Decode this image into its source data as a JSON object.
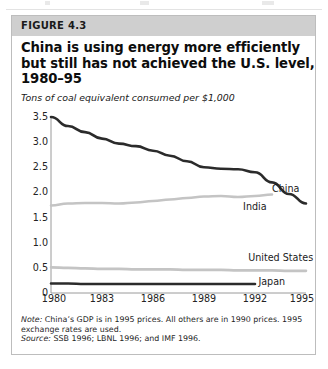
{
  "figure": {
    "band_label": "FIGURE 4.3",
    "title_lines": [
      "China is using energy more efficiently",
      "but still has not achieved the U.S. level,",
      "1980–95"
    ],
    "subtitle": "Tons of coal equivalent consumed per $1,000",
    "notes": {
      "note_kicker": "Note:",
      "note_line1": " China’s GDP is in 1995 prices. All others are in 1990 prices. 1995",
      "note_line2": "exchange rates are used.",
      "source_kicker": "Source:",
      "source_text": " SSB 1996; LBNL 1996; and IMF 1996."
    },
    "colors": {
      "band": "#cfcfcf",
      "border": "#bdbdbd",
      "dark_series": "#2b2b2b",
      "light_series": "#c4c4c4",
      "axis": "#9a9a9a",
      "text": "#1a1a1a"
    }
  },
  "chart_data": {
    "type": "line",
    "title": "China is using energy more efficiently but still has not achieved the U.S. level, 1980–95",
    "ylabel": "Tons of coal equivalent consumed per $1,000",
    "xlabel": "",
    "xlim": [
      1980,
      1995
    ],
    "ylim": [
      0,
      3.5
    ],
    "yticks": [
      0,
      0.5,
      1.0,
      1.5,
      2.0,
      2.5,
      3.0,
      3.5
    ],
    "ytick_labels": [
      "0",
      "0.5",
      "1.0",
      "1.5",
      "2.0",
      "2.5",
      "3.0",
      "3.5"
    ],
    "xticks": [
      1980,
      1983,
      1986,
      1989,
      1992,
      1995
    ],
    "xtick_labels": [
      "1980",
      "1983",
      "1986",
      "1989",
      "1992",
      "1995"
    ],
    "grid": false,
    "legend": "inline-labels",
    "x": [
      1980,
      1981,
      1982,
      1983,
      1984,
      1985,
      1986,
      1987,
      1988,
      1989,
      1990,
      1991,
      1992,
      1993,
      1994,
      1995
    ],
    "series": [
      {
        "name": "China",
        "label": "China",
        "color": "#2b2b2b",
        "width": 2.6,
        "label_x": 1993.0,
        "label_y": 2.06,
        "values": [
          3.5,
          3.32,
          3.2,
          3.07,
          2.97,
          2.92,
          2.83,
          2.73,
          2.62,
          2.5,
          2.47,
          2.46,
          2.4,
          2.2,
          1.97,
          1.78
        ]
      },
      {
        "name": "India",
        "label": "India",
        "color": "#c4c4c4",
        "width": 2.6,
        "label_x": 1991.3,
        "label_y": 1.72,
        "values": [
          1.74,
          1.78,
          1.79,
          1.79,
          1.78,
          1.8,
          1.83,
          1.86,
          1.89,
          1.92,
          1.93,
          1.91,
          1.93,
          1.96,
          null,
          null
        ]
      },
      {
        "name": "United States",
        "label": "United States",
        "color": "#c4c4c4",
        "width": 2.6,
        "label_x": 1991.6,
        "label_y": 0.7,
        "values": [
          0.51,
          0.5,
          0.49,
          0.48,
          0.48,
          0.47,
          0.47,
          0.47,
          0.46,
          0.46,
          0.46,
          0.45,
          0.45,
          0.45,
          0.44,
          0.44
        ]
      },
      {
        "name": "Japan",
        "label": "Japan",
        "color": "#2b2b2b",
        "width": 2.6,
        "label_x": 1992.2,
        "label_y": 0.22,
        "values": [
          0.19,
          0.19,
          0.18,
          0.18,
          0.18,
          0.18,
          0.18,
          0.18,
          0.18,
          0.18,
          0.18,
          0.18,
          0.18,
          null,
          null,
          null
        ]
      }
    ]
  }
}
